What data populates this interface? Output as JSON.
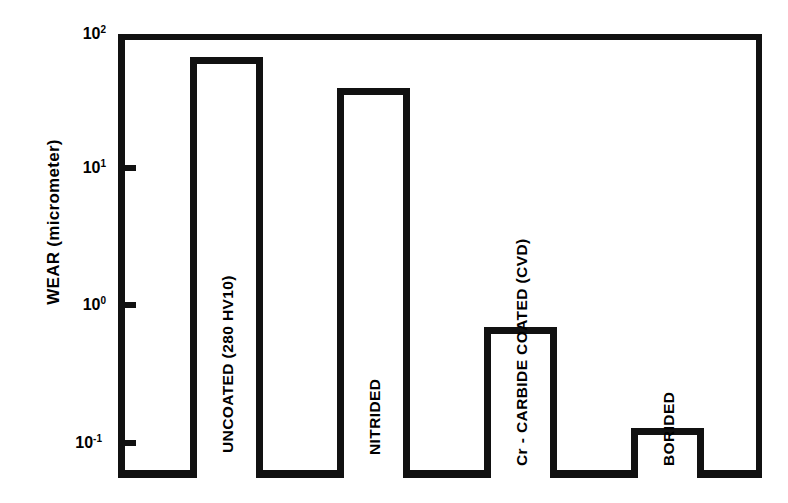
{
  "chart_data": {
    "type": "bar",
    "title": "",
    "subtitle": "",
    "xlabel": "",
    "ylabel": "WEAR (micrometer)",
    "yscale": "log",
    "ylim": [
      0.1,
      100
    ],
    "grid": false,
    "legend": "none",
    "ytick_labels": [
      "10",
      "10",
      "10",
      "10"
    ],
    "ytick_exponents": [
      "2",
      "1",
      "0",
      "-1"
    ],
    "ytick_values": [
      100,
      10,
      1,
      0.1
    ],
    "categories": [
      "UNCOATED (280 HV10)",
      "NITRIDED",
      "Cr - CARBIDE COATED (CVD)",
      "BORIDED"
    ],
    "values": [
      67,
      41,
      0.7,
      0.135
    ],
    "value_units": "micrometer",
    "bars": [
      {
        "label": "UNCOATED (280 HV10)",
        "value": 67,
        "left_px": 190,
        "width_px": 73,
        "top_px": 57
      },
      {
        "label": "NITRIDED",
        "value": 41,
        "left_px": 337,
        "width_px": 73,
        "top_px": 88
      },
      {
        "label": "Cr - CARBIDE COATED (CVD)",
        "value": 0.7,
        "left_px": 484,
        "width_px": 73,
        "top_px": 327
      },
      {
        "label": "BORIDED",
        "value": 0.135,
        "left_px": 631,
        "width_px": 73,
        "top_px": 428
      }
    ],
    "colors": {
      "bar_outline": "#111111",
      "bar_fill": "#ffffff",
      "axis": "#111111",
      "background": "#ffffff",
      "text": "#000000"
    }
  }
}
